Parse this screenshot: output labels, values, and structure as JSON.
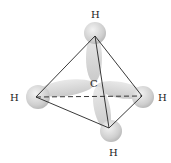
{
  "diagram": {
    "center_atom": "C",
    "hydrogens": [
      {
        "id": "top",
        "label": "H"
      },
      {
        "id": "left",
        "label": "H"
      },
      {
        "id": "right",
        "label": "H"
      },
      {
        "id": "bottom",
        "label": "H"
      }
    ],
    "colors": {
      "orbital": "#d4d4d4",
      "edge": "#222222",
      "background": "#ffffff"
    }
  }
}
